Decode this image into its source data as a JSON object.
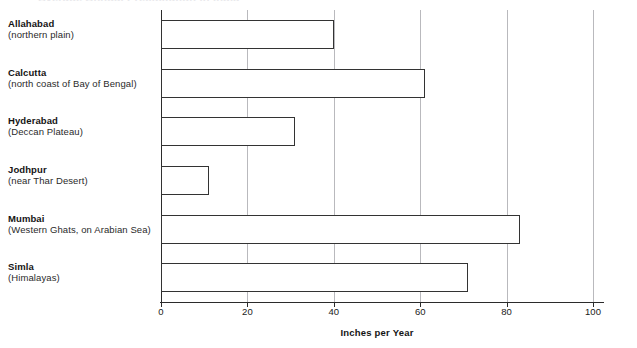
{
  "ghost_title": "Average Annual Precipitation in India",
  "chart_data": {
    "type": "bar",
    "orientation": "horizontal",
    "title": "",
    "xlabel": "Inches per Year",
    "ylabel": "",
    "xlim": [
      0,
      100
    ],
    "xticks": [
      0,
      20,
      40,
      60,
      80,
      100
    ],
    "xtick_labels": [
      "0",
      "20",
      "40",
      "60",
      "80",
      "100"
    ],
    "grid": "vertical",
    "legend": "none",
    "bar_fill": "#ffffff",
    "bar_edge": "#333333",
    "gridline_color": "#b9b9bd",
    "axis_color": "#2b2b2b",
    "categories": [
      "Allahabad",
      "Calcutta",
      "Hyderabad",
      "Jodhpur",
      "Mumbai",
      "Simla"
    ],
    "category_subtitles": [
      "(northern plain)",
      "(north coast of Bay of Bengal)",
      "(Deccan Plateau)",
      "(near Thar Desert)",
      "(Western Ghats, on Arabian Sea)",
      "(Himalayas)"
    ],
    "values": [
      40,
      61,
      31,
      11,
      83,
      71
    ],
    "series": [
      {
        "name": "Inches per Year",
        "values": [
          40,
          61,
          31,
          11,
          83,
          71
        ]
      }
    ]
  }
}
